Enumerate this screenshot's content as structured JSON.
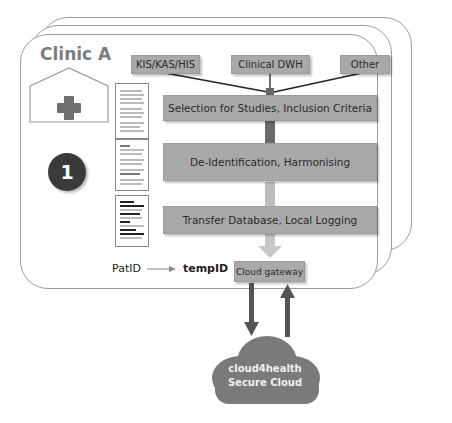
{
  "clinic": {
    "title": "Clinic A",
    "step_number": "1"
  },
  "sources": [
    {
      "label": "KIS/KAS/HIS"
    },
    {
      "label": "Clinical DWH"
    },
    {
      "label": "Other"
    }
  ],
  "steps": [
    {
      "label": "Selection for Studies, Inclusion Criteria"
    },
    {
      "label": "De-Identification, Harmonising"
    },
    {
      "label": "Transfer Database, Local Logging"
    }
  ],
  "id_mapping": {
    "from": "PatID",
    "to": "tempID"
  },
  "gateway": {
    "label": "Cloud gateway"
  },
  "cloud": {
    "line1": "cloud4health",
    "line2": "Secure Cloud"
  },
  "colors": {
    "box": "#a9a9a9",
    "cloud": "#7a7a7a",
    "badge": "#3a3a3a",
    "arrow_dark": "#5a5a5a",
    "arrow_light": "#c8c8c8"
  }
}
